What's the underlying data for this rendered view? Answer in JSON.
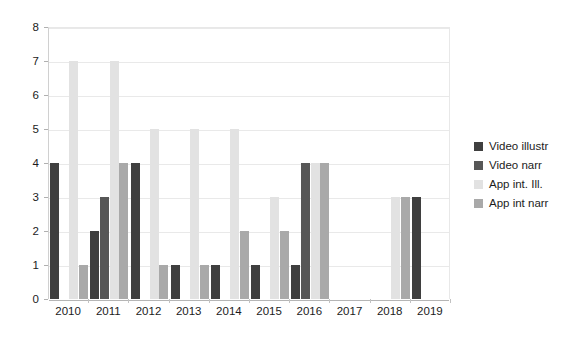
{
  "chart_data": {
    "type": "bar",
    "title": "",
    "subtitle": "",
    "xlabel": "",
    "ylabel": "",
    "ylim": [
      0,
      8
    ],
    "ytick_step": 1,
    "yticks": [
      0,
      1,
      2,
      3,
      4,
      5,
      6,
      7,
      8
    ],
    "grid": true,
    "grid_axis": "y",
    "legend_position": "right",
    "categories": [
      "2010",
      "2011",
      "2012",
      "2013",
      "2014",
      "2015",
      "2016",
      "2017",
      "2018",
      "2019"
    ],
    "series": [
      {
        "name": "Video illustr",
        "color": "#3f3f3f",
        "values": [
          4,
          2,
          4,
          1,
          1,
          1,
          1,
          0,
          0,
          3
        ]
      },
      {
        "name": "Video narr",
        "color": "#575757",
        "values": [
          0,
          3,
          0,
          0,
          0,
          0,
          4,
          0,
          0,
          0
        ]
      },
      {
        "name": "App int. Ill.",
        "color": "#e2e2e2",
        "values": [
          7,
          7,
          5,
          5,
          5,
          3,
          4,
          0,
          3,
          0
        ]
      },
      {
        "name": "App int narr",
        "color": "#a9a9a9",
        "values": [
          1,
          4,
          1,
          1,
          2,
          2,
          4,
          0,
          3,
          0
        ]
      }
    ]
  },
  "legend": {
    "items": [
      {
        "label": "Video illustr",
        "color": "#3f3f3f"
      },
      {
        "label": "Video narr",
        "color": "#575757"
      },
      {
        "label": "App int. Ill.",
        "color": "#e2e2e2"
      },
      {
        "label": "App int narr",
        "color": "#a9a9a9"
      }
    ]
  },
  "axes": {
    "y_labels": [
      "8",
      "7",
      "6",
      "5",
      "4",
      "3",
      "2",
      "1",
      "0"
    ],
    "x_labels": [
      "2010",
      "2011",
      "2012",
      "2013",
      "2014",
      "2015",
      "2016",
      "2017",
      "2018",
      "2019"
    ]
  }
}
